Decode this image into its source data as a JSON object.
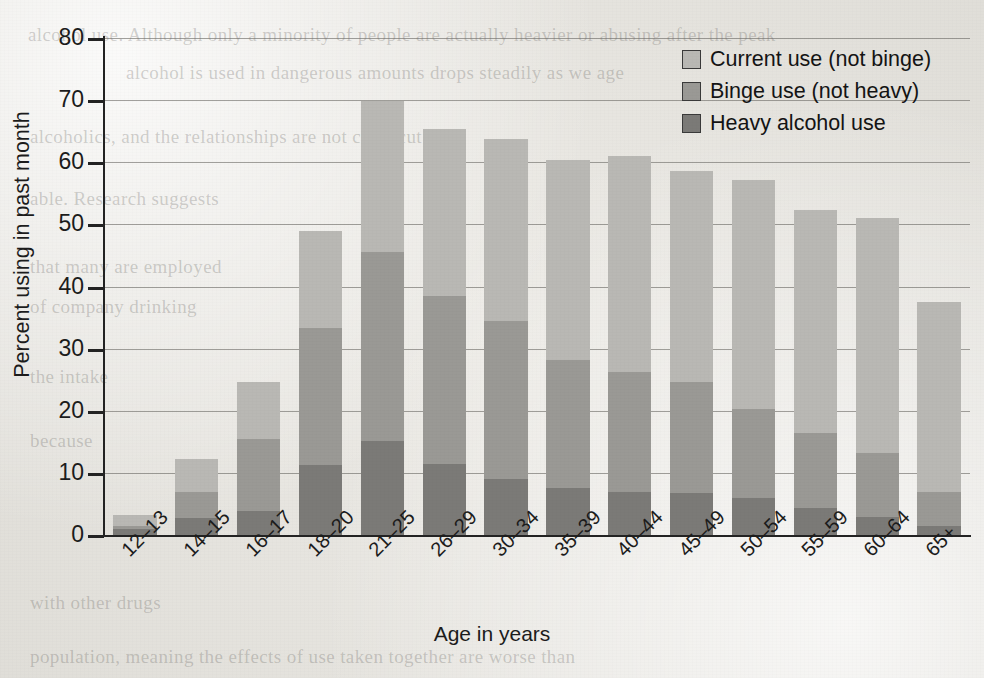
{
  "chart_data": {
    "type": "bar",
    "subtype": "stacked-bar",
    "title": "",
    "xlabel": "Age in years",
    "ylabel": "Percent using in past month",
    "ylim": [
      0,
      80
    ],
    "yticks": [
      0,
      10,
      20,
      30,
      40,
      50,
      60,
      70,
      80
    ],
    "grid": "horizontal",
    "legend_position": "top-right",
    "categories": [
      "12–13",
      "14–15",
      "16–17",
      "18–20",
      "21–25",
      "26–29",
      "30–34",
      "35–39",
      "40–44",
      "45–49",
      "50–54",
      "55–59",
      "60–64",
      "65+"
    ],
    "series": [
      {
        "name": "Heavy alcohol use",
        "color": "#7b7a77",
        "values": [
          1.0,
          2.8,
          3.8,
          11.3,
          15.2,
          11.4,
          9.0,
          7.5,
          7.0,
          6.8,
          6.0,
          4.4,
          2.9,
          1.4
        ]
      },
      {
        "name": "Binge use (not heavy)",
        "color": "#9a9995",
        "values": [
          0.4,
          4.2,
          11.6,
          22.0,
          30.4,
          27.1,
          25.4,
          20.6,
          19.2,
          17.8,
          14.3,
          12.0,
          10.3,
          5.6
        ]
      },
      {
        "name": "Current use (not binge)",
        "color": "#b9b8b4",
        "values": [
          1.8,
          5.2,
          9.3,
          15.6,
          24.2,
          26.8,
          29.4,
          32.2,
          34.8,
          34.0,
          36.8,
          35.9,
          37.8,
          30.5
        ]
      }
    ],
    "cumulative_tops": {
      "heavy": [
        1.0,
        2.8,
        3.8,
        11.3,
        15.2,
        11.4,
        9.0,
        7.5,
        7.0,
        6.8,
        6.0,
        4.4,
        2.9,
        1.4
      ],
      "binge": [
        1.4,
        7.0,
        15.4,
        33.3,
        45.6,
        38.5,
        34.4,
        28.1,
        26.2,
        24.6,
        20.3,
        16.4,
        13.2,
        7.0
      ],
      "total": [
        3.2,
        12.2,
        24.7,
        48.9,
        69.8,
        65.3,
        63.8,
        60.3,
        61.0,
        58.6,
        57.1,
        52.3,
        51.0,
        37.5
      ]
    }
  },
  "axes": {
    "y_label": "Percent using in past month",
    "x_label": "Age in years",
    "y_ticks": [
      "80",
      "70",
      "60",
      "50",
      "40",
      "30",
      "20",
      "10",
      "0"
    ]
  },
  "legend": {
    "items": [
      {
        "label": "Current use (not binge)",
        "color": "#b9b8b4"
      },
      {
        "label": "Binge use (not heavy)",
        "color": "#9a9995"
      },
      {
        "label": "Heavy alcohol use",
        "color": "#7b7a77"
      }
    ]
  },
  "background_bleed_text": [
    "alcohol use. Although only a minority of people are actually heavier or abusing after the peak",
    "alcohol is used in dangerous amounts drops steadily as we age",
    "alcoholics, and the relationships are not clear-cut",
    "able. Research suggests",
    "that many are employed",
    "of company drinking",
    "the intake",
    "because",
    "with other drugs",
    "population, meaning the effects of use taken together are worse than"
  ]
}
